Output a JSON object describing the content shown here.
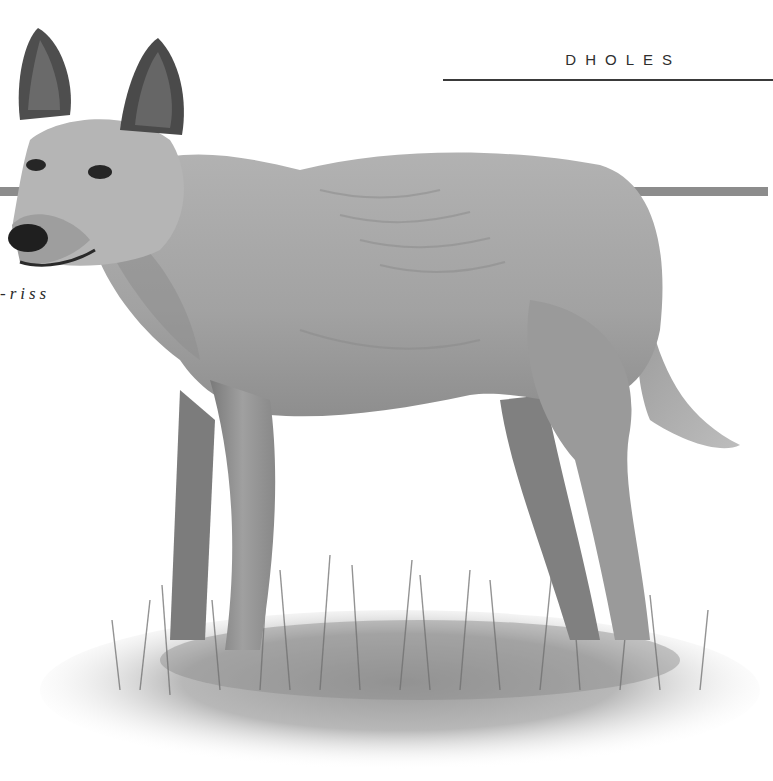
{
  "header": {
    "chapter_title": "DHOLES"
  },
  "body_text": {
    "pronunciation_fragment": "-riss"
  },
  "illustration": {
    "subject": "dhole standing in grass",
    "style": "grayscale painted illustration",
    "orientation": "facing left"
  },
  "colors": {
    "background": "#ffffff",
    "title_text": "#2e2e2e",
    "rule": "#3a3a3a",
    "accent_bar": "#8c8c8c",
    "fur_base": "#a8a8a8",
    "fur_light": "#c4c4c4",
    "fur_dark": "#6e6e6e",
    "grass": "#8a8a8a"
  }
}
